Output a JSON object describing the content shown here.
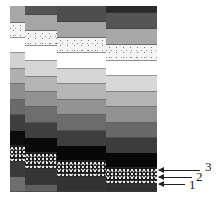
{
  "figure": {
    "columns": [
      {
        "id": "col1",
        "left": 10,
        "width": 15,
        "bands": [
          {
            "top": 0,
            "h": 17,
            "fill": "#a8a8a8"
          },
          {
            "top": 17,
            "h": 15,
            "fill": "speckle-light"
          },
          {
            "top": 32,
            "h": 15,
            "fill": "#ffffff"
          },
          {
            "top": 47,
            "h": 16,
            "fill": "#d2d2d2"
          },
          {
            "top": 63,
            "h": 15,
            "fill": "#b0b0b0"
          },
          {
            "top": 78,
            "h": 16,
            "fill": "#8e8e8e"
          },
          {
            "top": 94,
            "h": 15,
            "fill": "#6a6a6a"
          },
          {
            "top": 109,
            "h": 16,
            "fill": "#3e3e3e"
          },
          {
            "top": 125,
            "h": 15,
            "fill": "#0c0c0c"
          },
          {
            "top": 140,
            "h": 16,
            "fill": "speckle-dark"
          },
          {
            "top": 156,
            "h": 15,
            "fill": "#3a3a3a"
          },
          {
            "top": 171,
            "h": 15,
            "fill": "#6e6e6e"
          }
        ]
      },
      {
        "id": "col2",
        "left": 25,
        "width": 32,
        "bands": [
          {
            "top": 0,
            "h": 9,
            "fill": "#555555"
          },
          {
            "top": 9,
            "h": 16,
            "fill": "#a6a6a6"
          },
          {
            "top": 25,
            "h": 15,
            "fill": "speckle-light"
          },
          {
            "top": 40,
            "h": 15,
            "fill": "#ffffff"
          },
          {
            "top": 55,
            "h": 16,
            "fill": "#d6d6d6"
          },
          {
            "top": 71,
            "h": 15,
            "fill": "#b4b4b4"
          },
          {
            "top": 86,
            "h": 15,
            "fill": "#929292"
          },
          {
            "top": 101,
            "h": 16,
            "fill": "#6e6e6e"
          },
          {
            "top": 117,
            "h": 15,
            "fill": "#404040"
          },
          {
            "top": 132,
            "h": 15,
            "fill": "#0a0a0a"
          },
          {
            "top": 147,
            "h": 16,
            "fill": "speckle-dark"
          },
          {
            "top": 163,
            "h": 16,
            "fill": "#353535"
          },
          {
            "top": 179,
            "h": 7,
            "fill": "#5e5e5e"
          }
        ]
      },
      {
        "id": "col3",
        "left": 57,
        "width": 49,
        "bands": [
          {
            "top": 0,
            "h": 16,
            "fill": "#4e4e4e"
          },
          {
            "top": 16,
            "h": 16,
            "fill": "#a4a4a4"
          },
          {
            "top": 32,
            "h": 15,
            "fill": "speckle-light"
          },
          {
            "top": 47,
            "h": 16,
            "fill": "#ffffff"
          },
          {
            "top": 63,
            "h": 15,
            "fill": "#d6d6d6"
          },
          {
            "top": 78,
            "h": 16,
            "fill": "#b6b6b6"
          },
          {
            "top": 94,
            "h": 15,
            "fill": "#939393"
          },
          {
            "top": 109,
            "h": 16,
            "fill": "#6c6c6c"
          },
          {
            "top": 125,
            "h": 15,
            "fill": "#3e3e3e"
          },
          {
            "top": 140,
            "h": 15,
            "fill": "#080808"
          },
          {
            "top": 155,
            "h": 16,
            "fill": "speckle-dark"
          },
          {
            "top": 171,
            "h": 15,
            "fill": "#333333"
          }
        ]
      },
      {
        "id": "col4",
        "left": 106,
        "width": 51,
        "bands": [
          {
            "top": 0,
            "h": 7,
            "fill": "#2a2a2a"
          },
          {
            "top": 7,
            "h": 16,
            "fill": "#555555"
          },
          {
            "top": 23,
            "h": 16,
            "fill": "#a8a8a8"
          },
          {
            "top": 39,
            "h": 16,
            "fill": "speckle-light"
          },
          {
            "top": 55,
            "h": 15,
            "fill": "#ffffff"
          },
          {
            "top": 70,
            "h": 16,
            "fill": "#d8d8d8"
          },
          {
            "top": 86,
            "h": 15,
            "fill": "#b4b4b4"
          },
          {
            "top": 101,
            "h": 16,
            "fill": "#919191"
          },
          {
            "top": 117,
            "h": 15,
            "fill": "#686868"
          },
          {
            "top": 132,
            "h": 15,
            "fill": "#3c3c3c"
          },
          {
            "top": 147,
            "h": 15,
            "fill": "#080808"
          },
          {
            "top": 162,
            "h": 16,
            "fill": "speckle-dark"
          },
          {
            "top": 178,
            "h": 8,
            "fill": "#303030"
          }
        ]
      }
    ],
    "arrows": [
      {
        "label": "3",
        "y": 170,
        "x1": 159,
        "x2": 200,
        "label_x": 205,
        "label_y": 160
      },
      {
        "label": "2",
        "y": 177,
        "x1": 159,
        "x2": 192,
        "label_x": 196,
        "label_y": 170
      },
      {
        "label": "1",
        "y": 184,
        "x1": 159,
        "x2": 185,
        "label_x": 189,
        "label_y": 178
      }
    ]
  }
}
